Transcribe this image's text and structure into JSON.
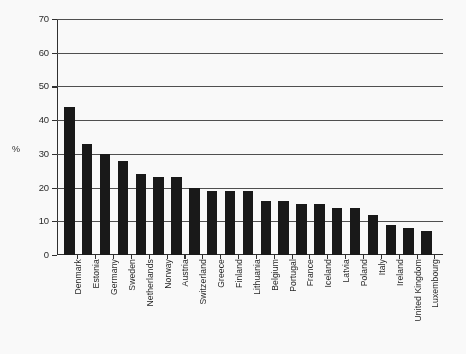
{
  "chart_data": {
    "type": "bar",
    "title": "",
    "subtitle": "",
    "xlabel": "",
    "ylabel": "%",
    "ylim": [
      0,
      70
    ],
    "ytick_step": 10,
    "yticks": [
      0,
      10,
      20,
      30,
      40,
      50,
      60,
      70
    ],
    "ytick_labels": [
      "0",
      "10",
      "20",
      "30",
      "40",
      "50",
      "60",
      "70"
    ],
    "grid": true,
    "grid_axis": "y",
    "legend": false,
    "legend_position": "none",
    "bar_color": "#111111",
    "categories": [
      "Denmark",
      "Estonia",
      "Germany",
      "Sweden",
      "Netherlands",
      "Norway",
      "Austria",
      "Switzerland",
      "Greece",
      "Finland",
      "Lithuania",
      "Belgium",
      "Portugal",
      "France",
      "Iceland",
      "Latvia",
      "Poland",
      "Italy",
      "Ireland",
      "United Kingdom",
      "Luxembourg"
    ],
    "values": [
      44,
      33,
      30,
      28,
      24,
      23,
      23,
      20,
      19,
      19,
      19,
      16,
      16,
      15,
      15,
      14,
      14,
      12,
      9,
      8,
      7
    ]
  },
  "axes": {
    "y_title": "%"
  }
}
